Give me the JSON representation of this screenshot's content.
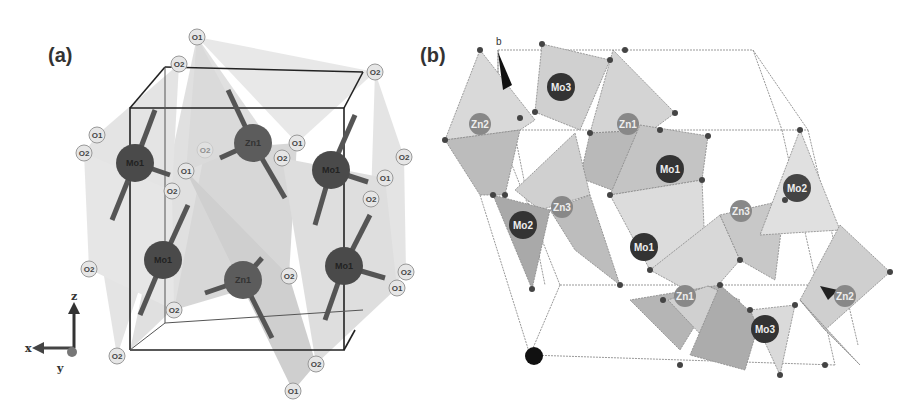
{
  "figure": {
    "panels": [
      {
        "label": "(a)",
        "metal_atoms": [
          {
            "label": "Mo1",
            "x": 135,
            "y": 163
          },
          {
            "label": "Zn1",
            "x": 253,
            "y": 143
          },
          {
            "label": "Mo1",
            "x": 331,
            "y": 170
          },
          {
            "label": "Mo1",
            "x": 163,
            "y": 260
          },
          {
            "label": "Zn1",
            "x": 243,
            "y": 280
          },
          {
            "label": "Mo1",
            "x": 344,
            "y": 266
          }
        ],
        "oxygen_atoms": [
          {
            "label": "O1",
            "x": 197,
            "y": 37
          },
          {
            "label": "O2",
            "x": 179,
            "y": 64
          },
          {
            "label": "O2",
            "x": 375,
            "y": 72
          },
          {
            "label": "O1",
            "x": 97,
            "y": 135
          },
          {
            "label": "O2",
            "x": 84,
            "y": 153
          },
          {
            "label": "O2",
            "x": 205,
            "y": 150
          },
          {
            "label": "O1",
            "x": 297,
            "y": 143
          },
          {
            "label": "O2",
            "x": 282,
            "y": 158
          },
          {
            "label": "O1",
            "x": 186,
            "y": 171
          },
          {
            "label": "O2",
            "x": 172,
            "y": 191
          },
          {
            "label": "O2",
            "x": 404,
            "y": 157
          },
          {
            "label": "O1",
            "x": 385,
            "y": 178
          },
          {
            "label": "O2",
            "x": 371,
            "y": 199
          },
          {
            "label": "O2",
            "x": 89,
            "y": 269
          },
          {
            "label": "O2",
            "x": 289,
            "y": 276
          },
          {
            "label": "O2",
            "x": 406,
            "y": 272
          },
          {
            "label": "O1",
            "x": 397,
            "y": 288
          },
          {
            "label": "O2",
            "x": 174,
            "y": 310
          },
          {
            "label": "O2",
            "x": 117,
            "y": 356
          },
          {
            "label": "O2",
            "x": 316,
            "y": 364
          },
          {
            "label": "O1",
            "x": 293,
            "y": 391
          }
        ],
        "axes": {
          "z": "z",
          "x": "x",
          "y": "y"
        }
      },
      {
        "label": "(b)",
        "axis_label": "b",
        "metal_atoms": [
          {
            "label": "Mo3",
            "x": 141,
            "y": 87,
            "type": "Mo"
          },
          {
            "label": "Zn2",
            "x": 60,
            "y": 124,
            "type": "Zn"
          },
          {
            "label": "Zn1",
            "x": 208,
            "y": 124,
            "type": "Zn"
          },
          {
            "label": "Mo1",
            "x": 250,
            "y": 169,
            "type": "Mo"
          },
          {
            "label": "Mo2",
            "x": 377,
            "y": 188,
            "type": "Mo"
          },
          {
            "label": "Mo2",
            "x": 103,
            "y": 225,
            "type": "Mo"
          },
          {
            "label": "Zn3",
            "x": 142,
            "y": 207,
            "type": "Zn"
          },
          {
            "label": "Zn3",
            "x": 321,
            "y": 211,
            "type": "Zn"
          },
          {
            "label": "Mo1",
            "x": 224,
            "y": 247,
            "type": "Mo"
          },
          {
            "label": "Zn1",
            "x": 265,
            "y": 296,
            "type": "Zn"
          },
          {
            "label": "Mo3",
            "x": 345,
            "y": 329,
            "type": "Mo"
          },
          {
            "label": "Zn2",
            "x": 425,
            "y": 296,
            "type": "Zn"
          }
        ]
      }
    ]
  }
}
